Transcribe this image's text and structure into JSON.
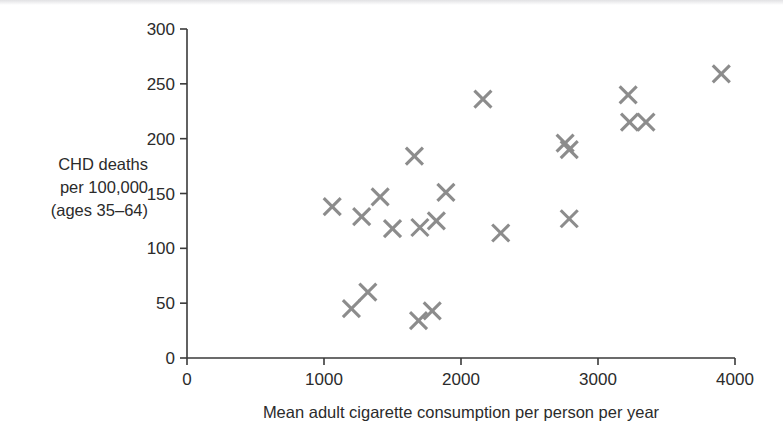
{
  "chart_data": {
    "type": "scatter",
    "title": "",
    "xlabel": "Mean adult cigarette consumption per person per year",
    "ylabel_lines": [
      "CHD deaths",
      "per 100,000",
      "(ages 35–64)"
    ],
    "xlim": [
      0,
      4000
    ],
    "ylim": [
      0,
      300
    ],
    "xticks": [
      0,
      1000,
      2000,
      3000,
      4000
    ],
    "yticks": [
      0,
      50,
      100,
      150,
      200,
      250,
      300
    ],
    "xticklabels": [
      "0",
      "1000",
      "2000",
      "3000",
      "4000"
    ],
    "yticklabels": [
      "0",
      "50",
      "100",
      "150",
      "200",
      "250",
      "300"
    ],
    "grid": false,
    "legend": null,
    "marker": "x",
    "marker_color": "#8c8c8c",
    "axis_color": "#3a3a3a",
    "series": [
      {
        "name": "Countries",
        "points": [
          {
            "x": 1060,
            "y": 138
          },
          {
            "x": 1200,
            "y": 45
          },
          {
            "x": 1275,
            "y": 129
          },
          {
            "x": 1320,
            "y": 60
          },
          {
            "x": 1410,
            "y": 147
          },
          {
            "x": 1500,
            "y": 118
          },
          {
            "x": 1660,
            "y": 184
          },
          {
            "x": 1690,
            "y": 34
          },
          {
            "x": 1700,
            "y": 119
          },
          {
            "x": 1790,
            "y": 43
          },
          {
            "x": 1820,
            "y": 125
          },
          {
            "x": 1890,
            "y": 151
          },
          {
            "x": 2160,
            "y": 236
          },
          {
            "x": 2290,
            "y": 114
          },
          {
            "x": 2760,
            "y": 196
          },
          {
            "x": 2790,
            "y": 190
          },
          {
            "x": 2790,
            "y": 127
          },
          {
            "x": 3220,
            "y": 240
          },
          {
            "x": 3230,
            "y": 215
          },
          {
            "x": 3350,
            "y": 215
          },
          {
            "x": 3900,
            "y": 259
          }
        ]
      }
    ]
  },
  "axes": {
    "x_title": "Mean adult cigarette consumption per person per year",
    "y_title_line1": "CHD deaths",
    "y_title_line2": "per 100,000",
    "y_title_line3": "(ages 35–64)"
  }
}
